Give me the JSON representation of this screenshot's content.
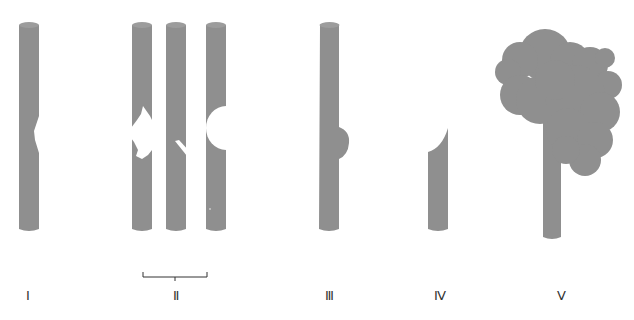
{
  "colors": {
    "rod": "#8f8f8f",
    "rod_top": "#9c9c9c",
    "background": "#ffffff",
    "ink": "#333333"
  },
  "figures": [
    {
      "id": "I",
      "label": "Ⅰ",
      "description": "rod with small notch on right side"
    },
    {
      "id": "II",
      "label": "Ⅱ",
      "description": "group of three rods: irregular bite on left, diagonal cut, semicircular cut on left"
    },
    {
      "id": "III",
      "label": "Ⅲ",
      "description": "rod with rounded bump protruding on right side"
    },
    {
      "id": "IV",
      "label": "Ⅳ",
      "description": "shortened rod with concave top cut"
    },
    {
      "id": "V",
      "label": "Ⅴ",
      "description": "rod topped by large cloud-like mass"
    }
  ]
}
